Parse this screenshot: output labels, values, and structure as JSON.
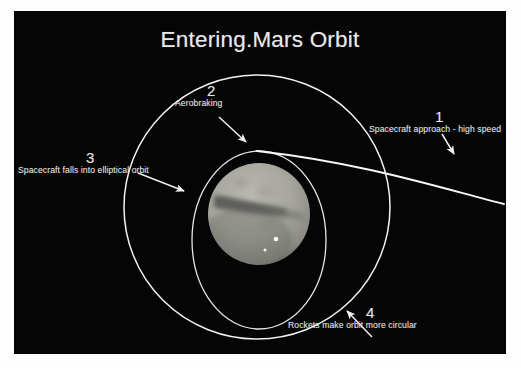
{
  "page": {
    "background_color": "#fdfdfd",
    "slide_background_color": "#050505"
  },
  "slide": {
    "title": "Entering.Mars Orbit",
    "title_color": "#e9e9e9"
  },
  "diagram": {
    "type": "orbital-insertion-schematic",
    "line_color": "#f2f2f2",
    "planet": {
      "name": "mars-disc",
      "disc_color": "#a9a9a1",
      "shadow_color": "#6d6d68",
      "albedo_feature_color": "#6a6a67",
      "highlight_color": "#f6f6f0",
      "center_x": 245,
      "center_y": 203,
      "radius": 51
    },
    "orbits": [
      {
        "name": "circular-orbit",
        "center_x": 243,
        "center_y": 196,
        "rx": 133,
        "ry": 132
      },
      {
        "name": "elliptical-orbit",
        "center_x": 245,
        "center_y": 229,
        "rx": 67,
        "ry": 89
      }
    ],
    "approach_trajectory": {
      "name": "hyperbolic-approach-path",
      "from_x": 490,
      "from_y": 193,
      "to_x": 243,
      "to_y": 140
    }
  },
  "callouts": [
    {
      "id": "1",
      "number": "1",
      "caption": "Spacecraft approach - high speed",
      "arrow": {
        "x1": 428,
        "y1": 123,
        "x2": 440,
        "y2": 143
      }
    },
    {
      "id": "2",
      "number": "2",
      "caption": "Aerobraking",
      "arrow": {
        "x1": 205,
        "y1": 106,
        "x2": 232,
        "y2": 131
      }
    },
    {
      "id": "3",
      "number": "3",
      "caption": "Spacecraft falls into elliptical orbit",
      "arrow": {
        "x1": 124,
        "y1": 162,
        "x2": 170,
        "y2": 180
      }
    },
    {
      "id": "4",
      "number": "4",
      "caption": "Rockets make orbit more circular",
      "arrow": {
        "x1": 358,
        "y1": 326,
        "x2": 333,
        "y2": 300
      }
    }
  ]
}
